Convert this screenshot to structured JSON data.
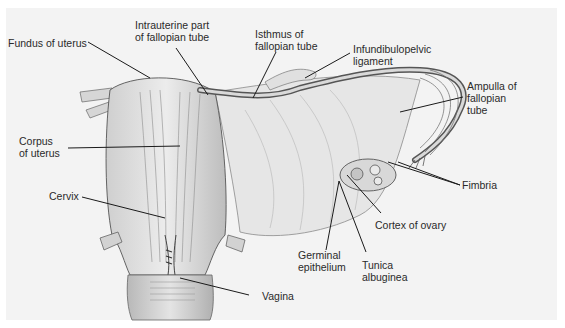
{
  "diagram": {
    "background_color": "#f3f3f3",
    "line_color": "#1a1a1a",
    "labels": [
      {
        "id": "fundus",
        "text": "Fundus of uterus"
      },
      {
        "id": "intrauterine",
        "text": "Intrauterine part\nof fallopian tube"
      },
      {
        "id": "isthmus",
        "text": "Isthmus of\nfallopian tube"
      },
      {
        "id": "infundibulopelvic",
        "text": "Infundibulopelvic\nligament"
      },
      {
        "id": "ampulla",
        "text": "Ampulla of\nfallopian\ntube"
      },
      {
        "id": "corpus",
        "text": "Corpus\nof uterus"
      },
      {
        "id": "fimbria",
        "text": "Fimbria"
      },
      {
        "id": "cervix",
        "text": "Cervix"
      },
      {
        "id": "cortex",
        "text": "Cortex of ovary"
      },
      {
        "id": "germinal",
        "text": "Germinal\nepithelium"
      },
      {
        "id": "tunica",
        "text": "Tunica\nalbuginea"
      },
      {
        "id": "vagina",
        "text": "Vagina"
      }
    ]
  }
}
